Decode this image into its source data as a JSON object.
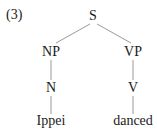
{
  "example_number": "(3)",
  "tree": {
    "root": "S",
    "nodes": {
      "s": "S",
      "np": "NP",
      "vp": "VP",
      "n": "N",
      "v": "V",
      "ippei": "Ippei",
      "danced": "danced"
    }
  }
}
